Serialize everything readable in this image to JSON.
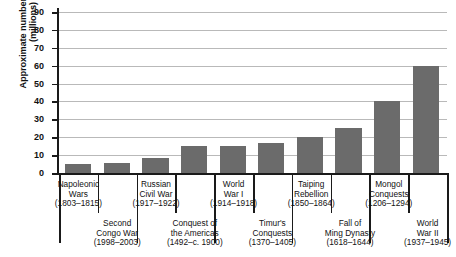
{
  "chart_data": {
    "type": "bar",
    "title": "",
    "subtitle": "",
    "xlabel": "",
    "ylabel": "Approximate number of deaths (millions)",
    "ylabel_lines": [
      "Approximate number of deaths",
      "(millions)"
    ],
    "ylim": [
      0,
      90
    ],
    "ytick_labels": [
      "0",
      "10",
      "20",
      "30",
      "40",
      "50",
      "60",
      "70",
      "80",
      "90"
    ],
    "ytick_values": [
      0,
      10,
      20,
      30,
      40,
      50,
      60,
      70,
      80,
      90
    ],
    "grid": true,
    "legend": "none",
    "categories": [
      "Napoleonic Wars",
      "Second Congo War",
      "Russian Civil War",
      "Conquest of the Americas",
      "World War I",
      "Timur's Conquests",
      "Taiping Rebellion",
      "Fall of Ming Dynasty",
      "Mongol Conquests",
      "World War II"
    ],
    "values": [
      5,
      5.4,
      8.5,
      15,
      15,
      17,
      20,
      25,
      40,
      60
    ],
    "bars": [
      {
        "name_lines": [
          "Napoleonic",
          "Wars"
        ],
        "years": "(1803–1815)",
        "value": 5,
        "row": "top"
      },
      {
        "name_lines": [
          "Second",
          "Congo War"
        ],
        "years": "(1998–2003)",
        "value": 5.4,
        "row": "bottom"
      },
      {
        "name_lines": [
          "Russian",
          "Civil War"
        ],
        "years": "(1917–1922)",
        "value": 8.5,
        "row": "top"
      },
      {
        "name_lines": [
          "Conquest of",
          "the Americas"
        ],
        "years": "(1492–c. 1900)",
        "value": 15,
        "row": "bottom"
      },
      {
        "name_lines": [
          "World",
          "War I"
        ],
        "years": "(1914–1918)",
        "value": 15,
        "row": "top"
      },
      {
        "name_lines": [
          "Timur's",
          "Conquests"
        ],
        "years": "(1370–1405)",
        "value": 17,
        "row": "bottom"
      },
      {
        "name_lines": [
          "Taiping",
          "Rebellion"
        ],
        "years": "(1850–1864)",
        "value": 20,
        "row": "top"
      },
      {
        "name_lines": [
          "Fall of",
          "Ming Dynasty"
        ],
        "years": "(1618–1644)",
        "value": 25,
        "row": "bottom"
      },
      {
        "name_lines": [
          "Mongol",
          "Conquests"
        ],
        "years": "(1206–1294)",
        "value": 40,
        "row": "top"
      },
      {
        "name_lines": [
          "World",
          "War II"
        ],
        "years": "(1937–1945)",
        "value": 60,
        "row": "bottom"
      }
    ],
    "colors": {
      "bar": "#6b6b6b",
      "axis": "#1a1a1a",
      "grid": "#b9b9b9",
      "background": "#ffffff",
      "text": "#111111"
    }
  }
}
